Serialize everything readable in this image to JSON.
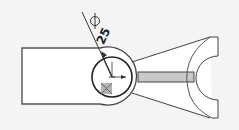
{
  "drawing": {
    "title": "Connecting rod sketch",
    "background_color": "#f4f4f4",
    "line_color": "#333333",
    "rib_fill_color": "#c8c8c8",
    "marker_fill_color": "#a0a0a0",
    "dimension": {
      "type": "diameter",
      "symbol": "Ø",
      "value": "25",
      "icon": "diameter-icon"
    },
    "features": [
      {
        "name": "left-block",
        "shape": "rectangle"
      },
      {
        "name": "boss-outer-arc",
        "shape": "arc"
      },
      {
        "name": "bore-circle",
        "shape": "circle"
      },
      {
        "name": "center-point",
        "shape": "cross-arrows"
      },
      {
        "name": "sketch-point-marker",
        "shape": "square"
      },
      {
        "name": "tapered-arm",
        "shape": "lines"
      },
      {
        "name": "center-rib",
        "shape": "rectangle"
      },
      {
        "name": "fork-end",
        "shape": "c-shape"
      }
    ]
  }
}
